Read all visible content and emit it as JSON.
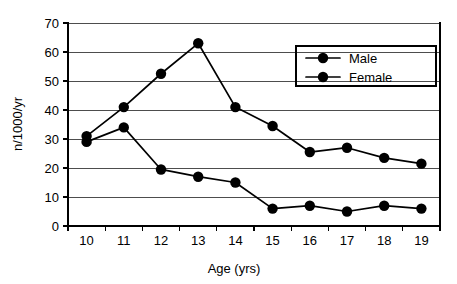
{
  "chart_data": {
    "type": "line",
    "title": "",
    "subtitle": "",
    "xlabel": "Age (yrs)",
    "ylabel": "n/1000/yr",
    "x": [
      10,
      11,
      12,
      13,
      14,
      15,
      16,
      17,
      18,
      19
    ],
    "xtick_labels": [
      "10",
      "11",
      "12",
      "13",
      "14",
      "15",
      "16",
      "17",
      "18",
      "19"
    ],
    "ytick_labels": [
      "0",
      "10",
      "20",
      "30",
      "40",
      "50",
      "60",
      "70"
    ],
    "yticks": [
      0,
      10,
      20,
      30,
      40,
      50,
      60,
      70
    ],
    "xlim": [
      9.5,
      19.5
    ],
    "ylim": [
      0,
      70
    ],
    "grid": "horizontal",
    "legend_position": "top-right",
    "series": [
      {
        "name": "Male",
        "marker": "filled-circle",
        "color": "#000000",
        "values": [
          31,
          41,
          52.5,
          63,
          41,
          34.5,
          25.5,
          27,
          23.5,
          21.5
        ]
      },
      {
        "name": "Female",
        "marker": "filled-circle",
        "color": "#000000",
        "values": [
          29,
          34,
          19.5,
          17,
          15,
          6,
          7,
          5,
          7,
          6
        ]
      }
    ]
  },
  "legend": {
    "entries": [
      {
        "label": "Male"
      },
      {
        "label": "Female"
      }
    ]
  },
  "axes": {
    "x_title": "Age (yrs)",
    "y_title": "n/1000/yr"
  }
}
